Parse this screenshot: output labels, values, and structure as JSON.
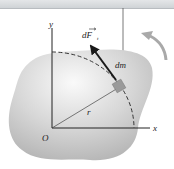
{
  "diagram": {
    "labels": {
      "y_axis": "y",
      "x_axis": "x",
      "origin": "O",
      "radius": "r",
      "mass_element": "dm",
      "force": "dF",
      "force_subscript": "t"
    },
    "colors": {
      "body_fill": "#c8c8c8",
      "body_highlight": "#f2f2f2",
      "axis": "#222222",
      "arrow": "#1a1a1a",
      "mass_square": "#9a9a9a",
      "rotation_arrow": "#a9a9a9",
      "top_bar": "#d8dbde"
    },
    "rotation_direction": "counterclockwise"
  }
}
